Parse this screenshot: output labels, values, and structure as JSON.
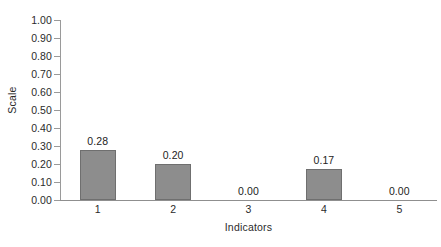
{
  "chart_data": {
    "type": "bar",
    "title": "",
    "categories": [
      "1",
      "2",
      "3",
      "4",
      "5"
    ],
    "values": [
      0.28,
      0.2,
      0.0,
      0.17,
      0.0
    ],
    "value_labels": [
      "0.28",
      "0.20",
      "0.00",
      "0.17",
      "0.00"
    ],
    "xlabel": "Indicators",
    "ylabel": "Scale",
    "ylim": [
      0.0,
      1.0
    ],
    "ytick_values": [
      1.0,
      0.9,
      0.8,
      0.7,
      0.6,
      0.5,
      0.4,
      0.3,
      0.2,
      0.1,
      0.0
    ],
    "ytick_labels": [
      "1.00",
      "0.90",
      "0.80",
      "0.70",
      "0.60",
      "0.50",
      "0.40",
      "0.30",
      "0.20",
      "0.10",
      "0.00"
    ],
    "grid": false,
    "legend": "none",
    "bar_color": "#8d8d8d",
    "bar_edge_color": "#6f6f6f",
    "axis_color": "#9a9a9a",
    "text_color": "#2b2b2b"
  }
}
